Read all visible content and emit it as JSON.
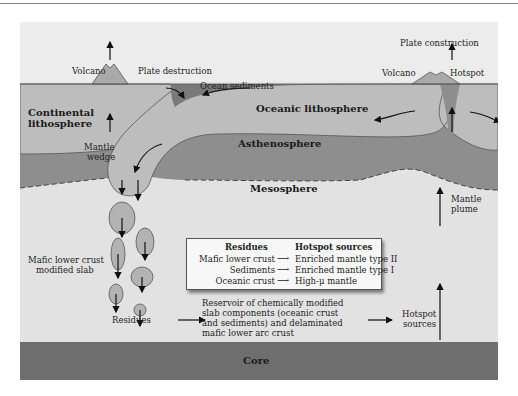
{
  "diagram": {
    "labels": {
      "volcano_left": "Volcano",
      "plate_destruction": "Plate destruction",
      "ocean_sediments": "Ocean sediments",
      "plate_construction": "Plate construction",
      "volcano_right": "Volcano",
      "hotspot": "Hotspot",
      "continental_lithosphere_1": "Continental",
      "continental_lithosphere_2": "lithosphere",
      "oceanic_lithosphere": "Oceanic lithosphere",
      "mantle_wedge_1": "Mantle",
      "mantle_wedge_2": "wedge",
      "asthenosphere": "Asthenosphere",
      "mesosphere": "Mesosphere",
      "mantle_plume_1": "Mantle",
      "mantle_plume_2": "plume",
      "mafic_slab_1": "Mafic lower crust",
      "mafic_slab_2": "modified slab",
      "residues": "Residues",
      "reservoir_1": "Reservoir of chemically modified",
      "reservoir_2": "slab components (oceanic crust",
      "reservoir_3": "and sediments) and delaminated",
      "reservoir_4": "mafic lower arc crust",
      "hotspot_sources_1": "Hotspot",
      "hotspot_sources_2": "sources",
      "core": "Core"
    },
    "legend": {
      "header_left": "Residues",
      "header_right": "Hotspot sources",
      "rows": [
        {
          "residue": "Mafic lower crust",
          "source": "Enriched mantle type II"
        },
        {
          "residue": "Sediments",
          "source": "Enriched mantle type I"
        },
        {
          "residue": "Oceanic crust",
          "source": "High-μ mantle"
        }
      ]
    },
    "colors": {
      "background": "#e6e6e6",
      "lithosphere": "#bdbdbd",
      "asthenosphere": "#8e8e8e",
      "mesosphere": "#e2e2e2",
      "core": "#6e6e6e",
      "sediments": "#7a7a7a",
      "legend_bg": "#f7f7f7"
    }
  }
}
